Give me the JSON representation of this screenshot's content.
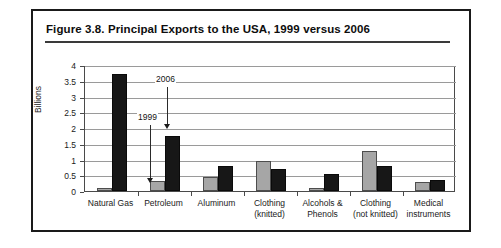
{
  "figure": {
    "title": "Figure 3.8.  Principal Exports to the USA, 1999 versus 2006"
  },
  "chart_data": {
    "type": "bar",
    "title": "Principal Exports to the USA, 1999 versus 2006",
    "xlabel": "",
    "ylabel": "Billions",
    "ylim": [
      0,
      4
    ],
    "yticks": [
      "0",
      "0.5",
      "1",
      "1.5",
      "2",
      "2.5",
      "3",
      "3.5",
      "4"
    ],
    "ytick_values": [
      0,
      0.5,
      1,
      1.5,
      2,
      2.5,
      3,
      3.5,
      4
    ],
    "grid": true,
    "legend": "none",
    "categories": [
      "Natural Gas",
      "Petroleum",
      "Aluminum",
      "Clothing (knitted)",
      "Alcohols & Phenols",
      "Clothing (not knitted)",
      "Medical instruments"
    ],
    "category_lines": [
      [
        "Natural Gas"
      ],
      [
        "Petroleum"
      ],
      [
        "Aluminum"
      ],
      [
        "Clothing",
        "(knitted)"
      ],
      [
        "Alcohols &",
        "Phenols"
      ],
      [
        "Clothing",
        "(not knitted)"
      ],
      [
        "Medical",
        "instruments"
      ]
    ],
    "series": [
      {
        "name": "1999",
        "color": "#a6a6a6",
        "values": [
          0.08,
          0.32,
          0.45,
          0.95,
          0.09,
          1.27,
          0.3
        ]
      },
      {
        "name": "2006",
        "color": "#171717",
        "values": [
          3.7,
          1.75,
          0.8,
          0.7,
          0.55,
          0.78,
          0.35
        ]
      }
    ],
    "annotations": [
      {
        "label": "2006",
        "points_to_series": "2006",
        "points_to_category": "Petroleum"
      },
      {
        "label": "1999",
        "points_to_series": "1999",
        "points_to_category": "Petroleum"
      }
    ]
  }
}
